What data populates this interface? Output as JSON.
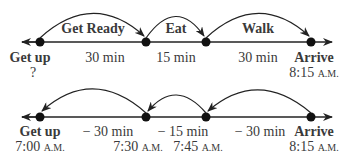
{
  "top": {
    "arcs": [
      "Get Ready",
      "Eat",
      "Walk"
    ],
    "intervals": [
      "30 min",
      "15 min",
      "30 min"
    ],
    "start_label": "Get up",
    "start_time": "?",
    "end_label": "Arrive",
    "end_time": "8:15",
    "end_ampm": "A.M."
  },
  "bottom": {
    "intervals": [
      "− 30 min",
      "− 15 min",
      "− 30 min"
    ],
    "start_label": "Get up",
    "start_time": "7:00",
    "start_ampm": "A.M.",
    "t2": "7:30",
    "t2_ampm": "A.M.",
    "t3": "7:45",
    "t3_ampm": "A.M.",
    "end_label": "Arrive",
    "end_time": "8:15",
    "end_ampm": "A.M."
  },
  "colors": {
    "line": "#222222",
    "text": "#3a3a3a"
  }
}
